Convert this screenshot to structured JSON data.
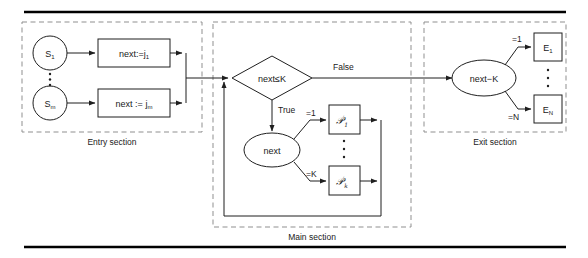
{
  "figure": {
    "colors": {
      "stroke": "#1f1f1f",
      "frame_dash": "#8f8f8f",
      "rule": "#000000",
      "background": "#ffffff"
    }
  },
  "rules": {
    "top": "horizontal-rule-top",
    "bottom": "horizontal-rule-bottom"
  },
  "sections": [
    {
      "id": "entry",
      "label": "Entry section",
      "nodes": [
        {
          "id": "s1",
          "shape": "circle",
          "label": "S",
          "sub": "1"
        },
        {
          "id": "sm",
          "shape": "circle",
          "label": "S",
          "sub": "m"
        },
        {
          "id": "assign1",
          "shape": "rect",
          "label": "next:=j",
          "sub": "1"
        },
        {
          "id": "assignm",
          "shape": "rect",
          "label": "next := j",
          "sub": "m"
        }
      ],
      "vertical_ellipsis": "⋮"
    },
    {
      "id": "main",
      "label": "Main section",
      "nodes": [
        {
          "id": "decision",
          "shape": "diamond",
          "label": "next≤K"
        },
        {
          "id": "next",
          "shape": "ellipse",
          "label": "next"
        },
        {
          "id": "proc1",
          "shape": "rect",
          "label": "𝒫",
          "prime": "′",
          "sub": "1"
        },
        {
          "id": "prock",
          "shape": "rect",
          "label": "𝒫",
          "prime": "′",
          "sub": "k"
        }
      ],
      "edge_labels": {
        "false": "False",
        "true": "True",
        "branch_first": "=1",
        "branch_last": "=K"
      },
      "vertical_ellipsis": "⋮"
    },
    {
      "id": "exit",
      "label": "Exit section",
      "nodes": [
        {
          "id": "nextminusk",
          "shape": "ellipse",
          "label": "next−K"
        },
        {
          "id": "e1",
          "shape": "rect",
          "label": "E",
          "sub": "1"
        },
        {
          "id": "en",
          "shape": "rect",
          "label": "E",
          "sub": "N"
        }
      ],
      "edge_labels": {
        "branch_first": "=1",
        "branch_last": "=N"
      },
      "vertical_ellipsis": "⋮"
    }
  ]
}
